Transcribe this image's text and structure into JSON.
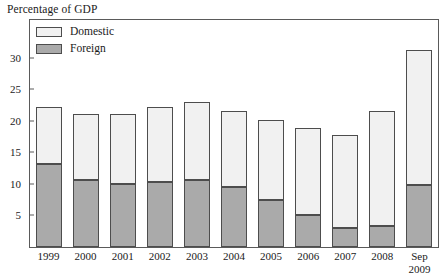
{
  "chart_data": {
    "type": "bar",
    "subtype": "stacked-vertical",
    "title": "Percentage of GDP",
    "xlabel": "",
    "ylabel": "",
    "categories": [
      "1999",
      "2000",
      "2001",
      "2002",
      "2003",
      "2004",
      "2005",
      "2006",
      "2007",
      "2008",
      "Sep 2009"
    ],
    "category_lines": [
      [
        "1999"
      ],
      [
        "2000"
      ],
      [
        "2001"
      ],
      [
        "2002"
      ],
      [
        "2003"
      ],
      [
        "2004"
      ],
      [
        "2005"
      ],
      [
        "2006"
      ],
      [
        "2007"
      ],
      [
        "2008"
      ],
      [
        "Sep",
        "2009"
      ]
    ],
    "series": [
      {
        "name": "Foreign",
        "color": "#aaaaaa",
        "values": [
          13.2,
          10.6,
          10.0,
          10.3,
          10.6,
          9.5,
          7.5,
          5.0,
          3.0,
          3.3,
          9.9
        ]
      },
      {
        "name": "Domestic",
        "color": "#f1f1f1",
        "values": [
          9.0,
          10.5,
          11.1,
          11.9,
          12.4,
          12.0,
          12.7,
          13.8,
          14.8,
          18.3,
          21.4
        ]
      }
    ],
    "totals": [
      22.2,
      21.1,
      21.1,
      22.2,
      23.0,
      21.5,
      20.2,
      18.8,
      17.8,
      21.6,
      31.3
    ],
    "stack_order_bottom_to_top": [
      "Foreign",
      "Domestic"
    ],
    "ylim": [
      0,
      36.0
    ],
    "yticks": [
      5,
      10,
      15,
      20,
      25,
      30
    ],
    "ytick_labels": [
      "5",
      "10",
      "15",
      "20",
      "25",
      "30"
    ],
    "grid": false,
    "legend_position": "top-left-inside",
    "legend_entries": [
      {
        "label": "Domestic",
        "color": "#f1f1f1"
      },
      {
        "label": "Foreign",
        "color": "#aaaaaa"
      }
    ]
  },
  "colors": {
    "domestic": "#f1f1f1",
    "foreign": "#aaaaaa",
    "bar_border": "#4d4d4d",
    "axis": "#5a5a5a",
    "text": "#1a1a1a",
    "background": "#ffffff"
  }
}
